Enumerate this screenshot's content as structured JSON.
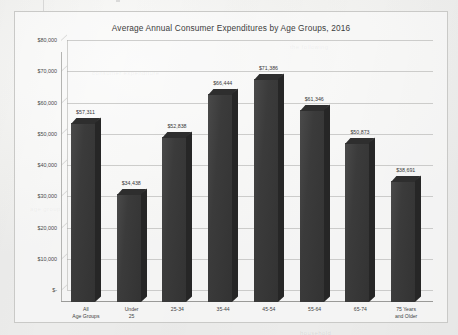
{
  "chart_data": {
    "type": "bar",
    "title": "Average Annual Consumer Expenditures by Age Groups, 2016",
    "xlabel": "",
    "ylabel": "",
    "categories": [
      "All\nAge Groups",
      "Under\n25",
      "25-34",
      "35-44",
      "45-54",
      "55-64",
      "65-74",
      "75 Years\nand Older"
    ],
    "values": [
      57311,
      34438,
      52838,
      66444,
      71386,
      61346,
      50873,
      38691
    ],
    "value_labels": [
      "$57,311",
      "$34,438",
      "$52,838",
      "$66,444",
      "$71,386",
      "$61,346",
      "$50,873",
      "$38,691"
    ],
    "ylim": [
      0,
      80000
    ],
    "ytick_values": [
      0,
      10000,
      20000,
      30000,
      40000,
      50000,
      60000,
      70000,
      80000
    ],
    "ytick_labels": [
      "$-",
      "$10,000",
      "$20,000",
      "$30,000",
      "$40,000",
      "$50,000",
      "$60,000",
      "$70,000",
      "$80,000"
    ],
    "grid": true,
    "legend": false,
    "series_color": "#3b3b3b",
    "style": "3d-column"
  },
  "page": {
    "background_color": "#f2f2f0",
    "frame_border_color": "#c9c9c7"
  },
  "artifacts": {
    "ghost_texts": [
      "the following",
      "consumer expenditure",
      "age group",
      "household"
    ]
  }
}
